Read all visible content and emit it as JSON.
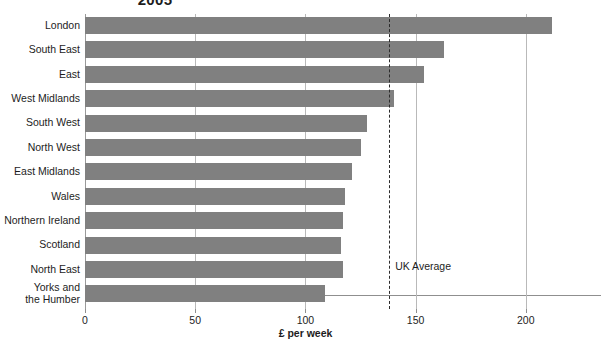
{
  "chart_data": {
    "type": "bar",
    "orientation": "horizontal",
    "title": "2005",
    "xlabel": "£ per week",
    "ylabel": "",
    "xlim": [
      0,
      220
    ],
    "ticks": [
      0,
      50,
      100,
      150,
      200
    ],
    "tick_labels": [
      "0",
      "50",
      "100",
      "150",
      "200"
    ],
    "grid": "vertical",
    "legend": "none",
    "bar_color": "#808080",
    "categories": [
      "London",
      "South East",
      "East",
      "West Midlands",
      "South West",
      "North West",
      "East Midlands",
      "Wales",
      "Northern Ireland",
      "Scotland",
      "North East",
      "Yorks and\nthe Humber"
    ],
    "values": [
      212,
      163,
      154,
      140,
      128,
      125,
      121,
      118,
      117,
      116,
      117,
      109
    ],
    "annotations": [
      {
        "name": "uk-average",
        "label": "UK Average",
        "value": 138,
        "style": "dashed-vertical-line",
        "color": "#2b2b2b"
      }
    ]
  }
}
